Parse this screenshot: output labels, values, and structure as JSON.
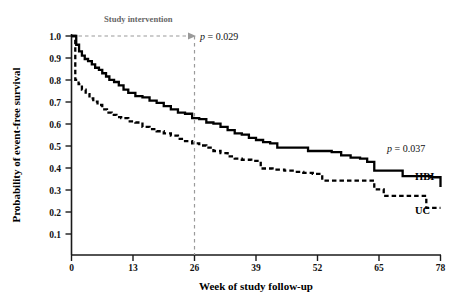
{
  "chart_data": {
    "type": "line",
    "subtype": "kaplan-meier-step",
    "title": "",
    "xlabel": "Week of study follow-up",
    "ylabel": "Probability of event-free survival",
    "xlim": [
      0,
      78
    ],
    "ylim": [
      0,
      1.0
    ],
    "xticks": [
      0,
      13,
      26,
      39,
      52,
      65,
      78
    ],
    "xticklabels": [
      "0",
      "13",
      "26",
      "39",
      "52",
      "65",
      "78"
    ],
    "yticks": [
      0.1,
      0.2,
      0.3,
      0.4,
      0.5,
      0.6,
      0.7,
      0.8,
      0.9,
      1.0
    ],
    "yticklabels": [
      "0.1",
      "0.2",
      "0.3",
      "0.4",
      "0.5",
      "0.6",
      "0.7",
      "0.8",
      "0.9",
      "1.0"
    ],
    "grid": false,
    "legend_position": "inline-right-end-of-curve",
    "series": [
      {
        "name": "HBI",
        "style": "solid",
        "color": "#000000",
        "label_at_end": "HBI",
        "final_value": 0.31,
        "points": [
          [
            0,
            1.0
          ],
          [
            1,
            0.96
          ],
          [
            1.6,
            0.93
          ],
          [
            2.2,
            0.91
          ],
          [
            2.8,
            0.895
          ],
          [
            3.5,
            0.885
          ],
          [
            4.3,
            0.87
          ],
          [
            5.0,
            0.855
          ],
          [
            5.8,
            0.845
          ],
          [
            6.5,
            0.83
          ],
          [
            7.3,
            0.815
          ],
          [
            8.0,
            0.8
          ],
          [
            9.0,
            0.79
          ],
          [
            10.0,
            0.775
          ],
          [
            11.0,
            0.755
          ],
          [
            12.0,
            0.74
          ],
          [
            13.5,
            0.725
          ],
          [
            15.0,
            0.72
          ],
          [
            16.5,
            0.705
          ],
          [
            18.0,
            0.695
          ],
          [
            19.5,
            0.68
          ],
          [
            21.0,
            0.665
          ],
          [
            22.5,
            0.65
          ],
          [
            24.0,
            0.645
          ],
          [
            25.5,
            0.625
          ],
          [
            27.0,
            0.62
          ],
          [
            28.5,
            0.605
          ],
          [
            30.0,
            0.6
          ],
          [
            31.5,
            0.585
          ],
          [
            33.0,
            0.57
          ],
          [
            34.5,
            0.555
          ],
          [
            36.0,
            0.55
          ],
          [
            37.5,
            0.535
          ],
          [
            39.0,
            0.525
          ],
          [
            40.5,
            0.515
          ],
          [
            42.0,
            0.51
          ],
          [
            43.5,
            0.49
          ],
          [
            46.0,
            0.49
          ],
          [
            50.0,
            0.475
          ],
          [
            52.0,
            0.475
          ],
          [
            55.0,
            0.47
          ],
          [
            57.0,
            0.455
          ],
          [
            59.0,
            0.445
          ],
          [
            61.0,
            0.44
          ],
          [
            62.5,
            0.425
          ],
          [
            64.0,
            0.385
          ],
          [
            68.0,
            0.385
          ],
          [
            70.0,
            0.36
          ],
          [
            74.0,
            0.36
          ],
          [
            76.0,
            0.355
          ],
          [
            78.0,
            0.31
          ]
        ]
      },
      {
        "name": "UC",
        "style": "dashed",
        "color": "#000000",
        "label_at_end": "UC",
        "final_value": 0.215,
        "points": [
          [
            0,
            1.0
          ],
          [
            0.8,
            0.8
          ],
          [
            1.5,
            0.78
          ],
          [
            2.2,
            0.755
          ],
          [
            3.0,
            0.735
          ],
          [
            3.8,
            0.715
          ],
          [
            4.6,
            0.7
          ],
          [
            5.5,
            0.685
          ],
          [
            6.5,
            0.665
          ],
          [
            7.5,
            0.65
          ],
          [
            8.5,
            0.64
          ],
          [
            9.5,
            0.63
          ],
          [
            10.5,
            0.625
          ],
          [
            12.0,
            0.61
          ],
          [
            13.5,
            0.605
          ],
          [
            15.0,
            0.585
          ],
          [
            16.5,
            0.575
          ],
          [
            18.0,
            0.565
          ],
          [
            19.5,
            0.555
          ],
          [
            21.0,
            0.545
          ],
          [
            22.5,
            0.53
          ],
          [
            24.0,
            0.52
          ],
          [
            25.5,
            0.51
          ],
          [
            27.0,
            0.5
          ],
          [
            28.5,
            0.49
          ],
          [
            30.0,
            0.475
          ],
          [
            31.5,
            0.465
          ],
          [
            33.0,
            0.45
          ],
          [
            34.5,
            0.44
          ],
          [
            36.0,
            0.435
          ],
          [
            38.0,
            0.43
          ],
          [
            40.0,
            0.395
          ],
          [
            42.5,
            0.39
          ],
          [
            45.0,
            0.385
          ],
          [
            47.0,
            0.38
          ],
          [
            49.0,
            0.375
          ],
          [
            51.0,
            0.37
          ],
          [
            53.0,
            0.34
          ],
          [
            58.0,
            0.34
          ],
          [
            62.0,
            0.34
          ],
          [
            64.0,
            0.3
          ],
          [
            66.0,
            0.27
          ],
          [
            70.0,
            0.27
          ],
          [
            73.0,
            0.27
          ],
          [
            75.0,
            0.215
          ],
          [
            78,
            0.215
          ]
        ]
      }
    ],
    "annotations": [
      {
        "name": "study-intervention",
        "text": "Study intervention",
        "x": 4,
        "y": 1.06,
        "style": "grey-bold"
      },
      {
        "name": "p-value-top",
        "text": "p = 0.029",
        "x": 27,
        "y": 1.0,
        "italic_lead": "p"
      },
      {
        "name": "p-value-right",
        "text": "p = 0.037",
        "x": 66,
        "y": 0.44,
        "italic_lead": "p"
      }
    ],
    "reference_line": {
      "name": "intervention-end",
      "x": 26,
      "style": "dashed-grey"
    },
    "arrow": {
      "name": "intervention-arrow",
      "from_x": 0,
      "to_x": 26,
      "y": 1.0,
      "style": "dashed-grey"
    }
  },
  "labels": {
    "ylabel": "Probability of event-free survival",
    "xlabel": "Week of study follow-up",
    "study_intervention": "Study intervention",
    "p_top": "p = 0.029",
    "p_right": "p = 0.037",
    "series_hbi": "HBI",
    "series_uc": "UC",
    "p_italic": "p",
    "p_top_rest": " = 0.029",
    "p_right_rest": " = 0.037"
  }
}
